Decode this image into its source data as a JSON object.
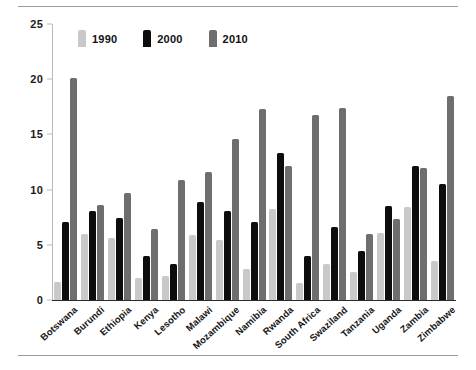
{
  "chart_data": {
    "type": "bar",
    "title": "",
    "subtitle": "",
    "xlabel": "",
    "ylabel": "",
    "ylim": [
      0,
      25
    ],
    "yticks": [
      0,
      5,
      10,
      15,
      20,
      25
    ],
    "grid": false,
    "legend_position": "top-left",
    "categories": [
      "Botswana",
      "Burundi",
      "Ethiopia",
      "Kenya",
      "Lesotho",
      "Malawi",
      "Mozambique",
      "Namibia",
      "Rwanda",
      "South Africa",
      "Swaziland",
      "Tanzania",
      "Uganda",
      "Zambia",
      "Zimbabwe"
    ],
    "series": [
      {
        "name": "1990",
        "color": "#c9c9c9",
        "values": [
          1.6,
          6.0,
          5.6,
          2.0,
          2.2,
          5.9,
          5.4,
          2.8,
          8.2,
          1.5,
          3.3,
          2.5,
          6.1,
          8.4,
          3.5
        ]
      },
      {
        "name": "2000",
        "color": "#0d0d0d",
        "values": [
          7.1,
          8.1,
          7.4,
          4.0,
          3.3,
          8.9,
          8.1,
          7.1,
          13.3,
          4.0,
          6.6,
          4.4,
          8.5,
          12.1,
          10.5
        ]
      },
      {
        "name": "2010",
        "color": "#6e6e6e",
        "values": [
          20.1,
          8.6,
          9.7,
          6.4,
          10.9,
          11.6,
          14.6,
          17.3,
          12.1,
          16.8,
          17.4,
          6.0,
          7.3,
          12.0,
          18.5
        ]
      }
    ]
  },
  "legend": {
    "items": [
      {
        "label": "1990",
        "key": "y1990"
      },
      {
        "label": "2000",
        "key": "y2000"
      },
      {
        "label": "2010",
        "key": "y2010"
      }
    ]
  }
}
